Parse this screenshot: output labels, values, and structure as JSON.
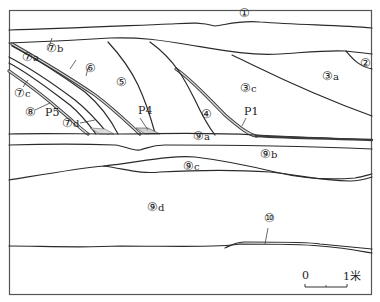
{
  "diagram": {
    "type": "geological stratigraphic section",
    "frame_color": "#555555",
    "line_color": "#2a2a2a",
    "background": "#ffffff"
  },
  "layers": [
    {
      "id": "1",
      "label": "①",
      "suffix": ""
    },
    {
      "id": "2",
      "label": "②",
      "suffix": ""
    },
    {
      "id": "3a",
      "label": "③",
      "suffix": "a"
    },
    {
      "id": "3c",
      "label": "③",
      "suffix": "c"
    },
    {
      "id": "4",
      "label": "④",
      "suffix": ""
    },
    {
      "id": "5",
      "label": "⑤",
      "suffix": ""
    },
    {
      "id": "6",
      "label": "⑥",
      "suffix": ""
    },
    {
      "id": "7a",
      "label": "⑦",
      "suffix": "a"
    },
    {
      "id": "7b",
      "label": "⑦",
      "suffix": "b"
    },
    {
      "id": "7c",
      "label": "⑦",
      "suffix": "c"
    },
    {
      "id": "7d",
      "label": "⑦",
      "suffix": "d"
    },
    {
      "id": "8",
      "label": "⑧",
      "suffix": ""
    },
    {
      "id": "9a",
      "label": "⑨",
      "suffix": "a"
    },
    {
      "id": "9b",
      "label": "⑨",
      "suffix": "b"
    },
    {
      "id": "9c",
      "label": "⑨",
      "suffix": "c"
    },
    {
      "id": "9d",
      "label": "⑨",
      "suffix": "d"
    },
    {
      "id": "10",
      "label": "⑩",
      "suffix": ""
    }
  ],
  "features": [
    {
      "id": "P1",
      "label": "P1"
    },
    {
      "id": "P4",
      "label": "P4"
    },
    {
      "id": "P5",
      "label": "P5"
    }
  ],
  "scale_bar": {
    "start_label": "0",
    "end_label": "1米"
  }
}
